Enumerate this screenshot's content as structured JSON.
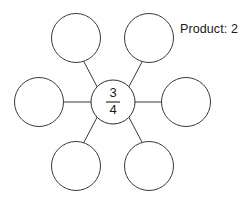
{
  "diagram": {
    "type": "fraction-multiplication-web",
    "center": {
      "name": "center-node",
      "numerator": "3",
      "denominator": "4",
      "fraction_text": "3/4"
    },
    "outer_nodes": [
      {
        "position": "top-left",
        "label": ""
      },
      {
        "position": "top-right",
        "label": ""
      },
      {
        "position": "left",
        "label": ""
      },
      {
        "position": "right",
        "label": ""
      },
      {
        "position": "bottom-left",
        "label": ""
      },
      {
        "position": "bottom-right",
        "label": ""
      }
    ],
    "annotation": {
      "label": "Product: 2",
      "prefix": "Product:",
      "value": "2"
    },
    "colors": {
      "stroke": "#3a3a3a",
      "text": "#1a1a1a",
      "background": "#fefefe",
      "node_fill": "#ffffff"
    }
  }
}
